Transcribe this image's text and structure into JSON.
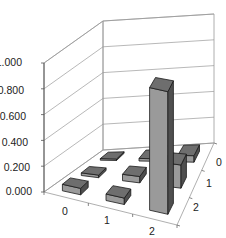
{
  "chart_data": {
    "type": "bar3d",
    "title": "",
    "xlabel": "",
    "ylabel": "",
    "zlabel": "",
    "ylim": [
      0,
      1
    ],
    "grid": true,
    "legend": null,
    "y_ticks": [
      "0.000",
      "0.200",
      "0.400",
      "0.600",
      "0.800",
      "1.000"
    ],
    "x_categories": [
      "0",
      "1",
      "2"
    ],
    "depth_categories": [
      "0",
      "1",
      "2"
    ],
    "series": [
      {
        "name": "0",
        "values": [
          0.01,
          0.02,
          0.05
        ]
      },
      {
        "name": "1",
        "values": [
          0.02,
          0.05,
          0.05
        ]
      },
      {
        "name": "2",
        "values": [
          0.05,
          0.18,
          0.95
        ]
      }
    ],
    "series_note": "series name = depth row; values indexed by x category 0,1,2",
    "colors": {
      "bar_front": "#9a9a9a",
      "bar_top": "#6e6e6e",
      "bar_side": "#4f4f4f",
      "bar_edge": "#1a1a1a",
      "grid": "#9a9a9a",
      "axis": "#555555"
    }
  },
  "labels": {
    "y": [
      "0.000",
      "0.200",
      "0.400",
      "0.600",
      "0.800",
      "1.000"
    ],
    "x": [
      "0",
      "1",
      "2"
    ],
    "depth": [
      "0",
      "1",
      "2"
    ]
  }
}
